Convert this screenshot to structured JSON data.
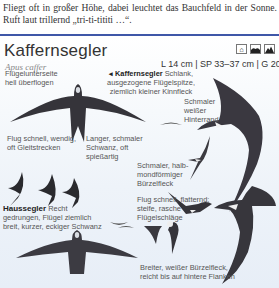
{
  "intro_text": "Fliegt oft in großer Höhe, dabei leuchtet das Bauchfeld in der Sonne. Ruft laut trillernd „tri-ti-tititi …“.",
  "species": {
    "name": "Kaffernsegler",
    "latin": "Apus caffer",
    "measurements": "L 14 cm | SP 33–37 cm | G 20–30 g",
    "habitat_icons": [
      "building-icon",
      "hills-icon",
      "mountain-icon"
    ]
  },
  "annotations": {
    "underwing": "Flügelunterseite hell überflogen",
    "kaffernsegler_title": "◂ Kaffernsegler",
    "kaffernsegler_desc": " Schlank, ausgezogene Flügelspitze, ziemlich kleiner Kinnfleck",
    "hinterrand": "Schmaler weißer Hinterrand",
    "flight_fast": "Flug schnell, wendig, oft Gleitstrecken",
    "tail_long": "Langer, schmaler Schwanz, oft spießartig",
    "rump_narrow": "Schmaler, halb-mondförmiger Bürzelfleck",
    "haussegler_title": "Haussegler",
    "haussegler_desc": " Recht gedrungen, Flügel ziemlich breit, kurzer, eckiger Schwanz",
    "flight_flutter": "Flug schnell, flatternd; steife, rasche Flügelschläge",
    "rump_broad": "Breiter, weißer Bürzelfleck, reicht bis auf hintere Flanken"
  },
  "colors": {
    "divider": "#3f57a8",
    "bird_dark": "#2b2a2e",
    "bird_mid": "#4a4850"
  }
}
